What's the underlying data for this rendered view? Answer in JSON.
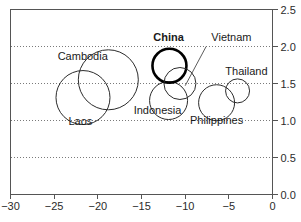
{
  "chart_data": {
    "type": "scatter",
    "title": "",
    "subtitle": "",
    "xlabel": "",
    "ylabel": "",
    "xlim": [
      -30,
      0
    ],
    "ylim": [
      0.0,
      2.5
    ],
    "grid": true,
    "grid_axis": "y",
    "grid_values": [
      0.5,
      1.0,
      1.5,
      2.0
    ],
    "legend": "none",
    "xticks": [
      -30,
      -25,
      -20,
      -15,
      -10,
      -5,
      0
    ],
    "xtick_labels": [
      "−30",
      "−25",
      "−20",
      "−15",
      "−10",
      "−5",
      "0"
    ],
    "yticks": [
      0.0,
      0.5,
      1.0,
      1.5,
      2.0,
      2.5
    ],
    "ytick_labels": [
      "0.0",
      "0.5",
      "1.0",
      "1.5",
      "2.0",
      "2.5"
    ],
    "yaxis_position": "right",
    "series": [
      {
        "name": "countries",
        "marker": "open-circle",
        "points": [
          {
            "label": "Cambodia",
            "x": -18.8,
            "y": 1.55,
            "r_px": 30,
            "highlight": false,
            "label_x": -24.6,
            "label_y": 1.82,
            "label_anchor": "start",
            "leader": false
          },
          {
            "label": "Laos",
            "x": -21.7,
            "y": 1.31,
            "r_px": 27,
            "highlight": false,
            "label_x": -22.0,
            "label_y": 0.94,
            "label_anchor": "middle",
            "leader": false
          },
          {
            "label": "Indonesia",
            "x": -11.9,
            "y": 1.27,
            "r_px": 19,
            "highlight": false,
            "label_x": -15.9,
            "label_y": 1.09,
            "label_anchor": "start",
            "leader": false
          },
          {
            "label": "China",
            "x": -11.8,
            "y": 1.74,
            "r_px": 17,
            "highlight": true,
            "label_x": -11.9,
            "label_y": 2.08,
            "label_anchor": "middle",
            "leader": false
          },
          {
            "label": "Vietnam",
            "x": -10.6,
            "y": 1.5,
            "r_px": 16,
            "highlight": false,
            "label_x": -7.0,
            "label_y": 2.08,
            "label_anchor": "start",
            "leader": true,
            "leader_from_x": -7.6,
            "leader_from_y": 2.0,
            "leader_to_x": -10.0,
            "leader_to_y": 1.47
          },
          {
            "label": "Philippines",
            "x": -6.4,
            "y": 1.24,
            "r_px": 18,
            "highlight": false,
            "label_x": -6.4,
            "label_y": 0.95,
            "label_anchor": "middle",
            "leader": false
          },
          {
            "label": "Thailand",
            "x": -4.0,
            "y": 1.4,
            "r_px": 12,
            "highlight": false,
            "label_x": -5.4,
            "label_y": 1.61,
            "label_anchor": "start",
            "leader": false
          }
        ]
      }
    ]
  },
  "colors": {
    "bubble_stroke": "#2b2b2b",
    "highlight_stroke": "#000000",
    "axis": "#555555",
    "grid": "#7a7a7a",
    "background": "#ffffff"
  }
}
